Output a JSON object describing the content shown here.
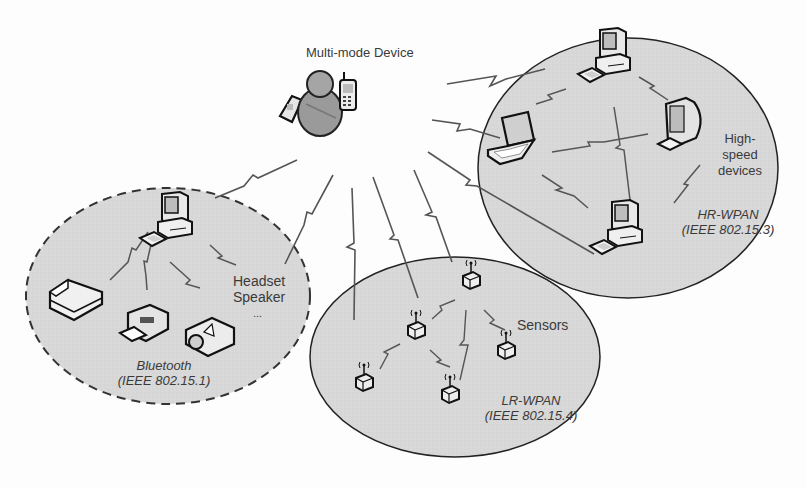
{
  "title": "Multi-mode Device",
  "colors": {
    "area_fill": "#d9d9d9",
    "outline": "#2a2a2a",
    "link": "#555555",
    "text": "#3a3a3a"
  },
  "center_device": {
    "label": "Multi-mode Device",
    "icons": [
      "flip-phone-icon",
      "user-icon",
      "mobile-phone-icon"
    ]
  },
  "networks": [
    {
      "id": "bluetooth",
      "name": "Bluetooth",
      "standard": "(IEEE 802.15.1)",
      "boundary": "dashed",
      "devices": [
        "desktop-computer",
        "scanner",
        "fax-printer",
        "projector"
      ],
      "extra_label_lines": [
        "Headset",
        "Speaker",
        "..."
      ]
    },
    {
      "id": "lr-wpan",
      "name": "LR-WPAN",
      "standard": "(IEEE 802.15.4)",
      "boundary": "solid",
      "devices": [
        "sensor",
        "sensor",
        "sensor",
        "sensor",
        "sensor"
      ],
      "extra_label_lines": [
        "Sensors"
      ]
    },
    {
      "id": "hr-wpan",
      "name": "HR-WPAN",
      "standard": "(IEEE 802.15.3)",
      "boundary": "solid",
      "devices": [
        "desktop-computer",
        "laptop",
        "crt-monitor",
        "desktop-computer"
      ],
      "extra_label_lines": [
        "High-",
        "speed",
        "devices"
      ]
    }
  ]
}
